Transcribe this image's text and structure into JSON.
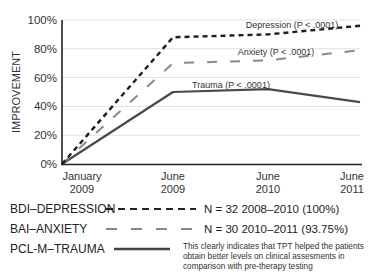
{
  "chart_data": {
    "type": "line",
    "title": "",
    "xlabel": "",
    "ylabel": "IMPROVEMENT",
    "ylim": [
      0,
      100
    ],
    "yticks": [
      "0%",
      "20%",
      "40%",
      "60%",
      "80%",
      "100%"
    ],
    "grid": true,
    "categories": [
      "January 2009",
      "June 2009",
      "June 2010",
      "June 2011"
    ],
    "x_labels": [
      {
        "line1": "January",
        "line2": "2009"
      },
      {
        "line1": "June",
        "line2": "2009"
      },
      {
        "line1": "June",
        "line2": "2010"
      },
      {
        "line1": "June",
        "line2": "2011"
      }
    ],
    "series": [
      {
        "name": "BDI-DEPRESSION",
        "annotation": "Depression (P < .0001)",
        "style": "dotted-dash",
        "color": "#222222",
        "values": [
          0,
          88,
          90,
          96
        ]
      },
      {
        "name": "BAI-ANXIETY",
        "annotation": "Anxiety (P < .0001)",
        "style": "long-dash",
        "color": "#999999",
        "values": [
          0,
          70,
          72,
          79
        ]
      },
      {
        "name": "PCL-M-TRAUMA",
        "annotation": "Trauma (P < .0001)",
        "style": "solid",
        "color": "#555555",
        "values": [
          0,
          50,
          52,
          43
        ]
      }
    ],
    "legend_position": "bottom"
  },
  "legend": {
    "items": [
      {
        "label": "BDI–DEPRESSION",
        "note": "N = 32 2008–2010 (100%)"
      },
      {
        "label": "BAI–ANXIETY",
        "note": "N = 30 2010–2011 (93.75%)"
      },
      {
        "label": "PCL-M–TRAUMA",
        "note": ""
      }
    ],
    "footnote": "This clearly indicates that TPT helped the patients obtain better levels on clinical assesments in comparison with pre-therapy testing"
  }
}
